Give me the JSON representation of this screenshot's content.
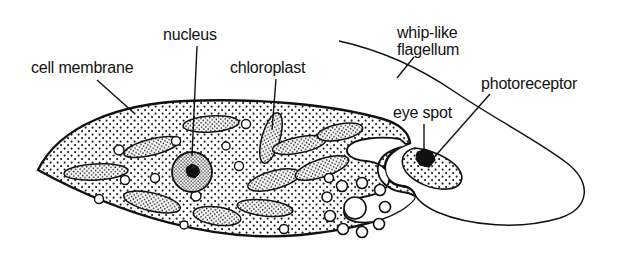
{
  "figure": {
    "organism": "Euglena",
    "style": "black-and-white line drawing with stipple shading",
    "width": 631,
    "height": 265,
    "background_color": "#ffffff",
    "ink_color": "#111111"
  },
  "labels": {
    "cell_membrane": "cell membrane",
    "nucleus": "nucleus",
    "chloroplast": "chloroplast",
    "flagellum_line1": "whip-like",
    "flagellum_line2": "flagellum",
    "eye_spot": "eye spot",
    "photoreceptor": "photoreceptor"
  },
  "parts": [
    {
      "name": "cell-membrane",
      "label": "cell membrane",
      "description": "outer boundary of the lens-shaped cell body, pointed at the left tip",
      "leader": {
        "from": [
          97,
          80
        ],
        "to": [
          134,
          113
        ]
      }
    },
    {
      "name": "nucleus",
      "label": "nucleus",
      "description": "large round densely stippled organelle with a dark central nucleolus",
      "leader": {
        "from": [
          197,
          46
        ],
        "to": [
          193,
          156
        ]
      }
    },
    {
      "name": "chloroplast",
      "label": "chloroplast",
      "description": "elongated oval stippled bodies scattered through the cytoplasm",
      "leader": {
        "from": [
          276,
          79
        ],
        "to": [
          272,
          130
        ]
      }
    },
    {
      "name": "whip-like-flagellum",
      "label": "whip-like flagellum",
      "description": "long looping thread emerging from the gullet at the right end of the cell",
      "leader": {
        "from": [
          414,
          57
        ],
        "to": [
          398,
          77
        ]
      }
    },
    {
      "name": "eye-spot",
      "label": "eye spot",
      "description": "small solid black pigment blob beside the reservoir",
      "leader": {
        "from": [
          424,
          124
        ],
        "to": [
          424,
          156
        ]
      }
    },
    {
      "name": "photoreceptor",
      "label": "photoreceptor",
      "description": "light-sensitive swelling at the base of the flagellum",
      "leader": {
        "from": [
          490,
          95
        ],
        "to": [
          430,
          160
        ]
      }
    },
    {
      "name": "contractile-vacuole",
      "label": "",
      "description": "large clear central circle ringed by about ten small clear circles"
    },
    {
      "name": "reservoir-gullet",
      "label": "",
      "description": "clear unstippled channel opening at the right end of the cell"
    }
  ]
}
